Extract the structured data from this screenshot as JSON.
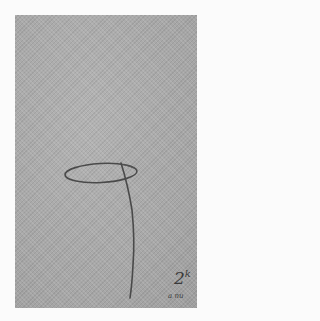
{
  "image": {
    "description": "Scanned line drawing on gray textured paper: an elliptical loop with a single curved stroke descending from it",
    "background_color": "#fbfbfb",
    "paper_color": "#a9a9a9",
    "stroke_color": "#4a4a4a"
  },
  "annotation": {
    "base": "2",
    "superscript": "k",
    "subtext": "a nu"
  }
}
